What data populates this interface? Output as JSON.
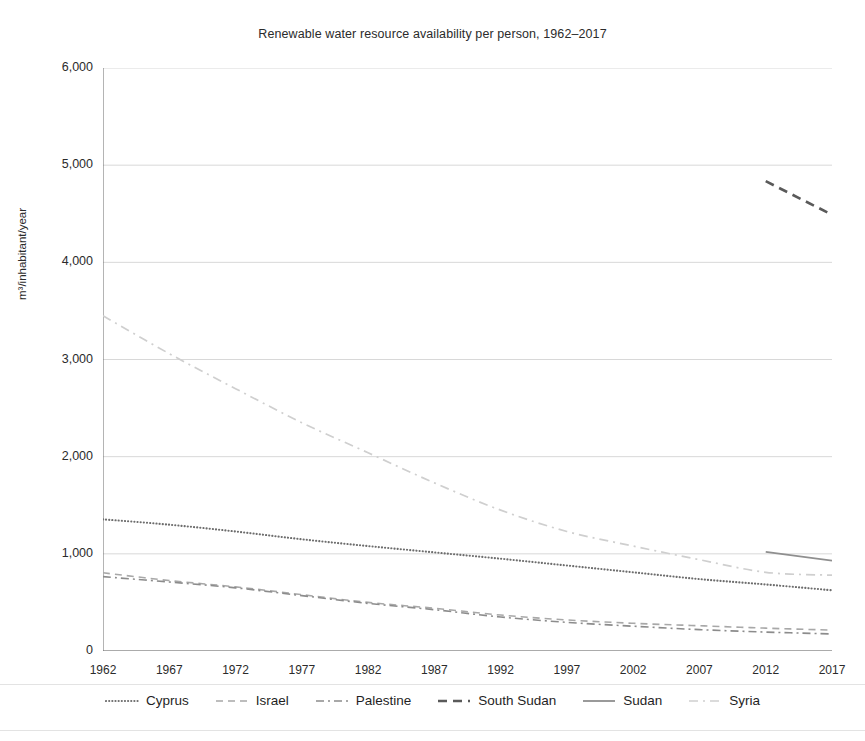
{
  "chart_data": {
    "type": "line",
    "title": "Renewable water resource availability per person, 1962–2017",
    "xlabel": "",
    "ylabel": "m³/inhabitant/year",
    "grid": true,
    "legend_position": "bottom",
    "xlim": [
      1962,
      2017
    ],
    "ylim": [
      0,
      6000
    ],
    "ytick_labels": [
      "6,000",
      "5,000",
      "4,000",
      "3,000",
      "2,000",
      "1,000",
      "0"
    ],
    "ytick_values": [
      6000,
      5000,
      4000,
      3000,
      2000,
      1000,
      0
    ],
    "xtick_labels": [
      "1962",
      "1967",
      "1972",
      "1977",
      "1982",
      "1987",
      "1992",
      "1997",
      "2002",
      "2007",
      "2012",
      "2017"
    ],
    "xtick_values": [
      1962,
      1967,
      1972,
      1977,
      1982,
      1987,
      1992,
      1997,
      2002,
      2007,
      2012,
      2017
    ],
    "series": [
      {
        "name": "Cyprus",
        "dash": "dotted",
        "color": "#6d6d6d",
        "width": 2.1,
        "x": [
          1962,
          1967,
          1972,
          1977,
          1982,
          1987,
          1992,
          1997,
          2002,
          2007,
          2012,
          2017
        ],
        "values": [
          1355,
          1300,
          1230,
          1150,
          1080,
          1015,
          950,
          880,
          810,
          740,
          685,
          625
        ]
      },
      {
        "name": "Israel",
        "dash": "dashed",
        "color": "#a8a8a8",
        "width": 1.6,
        "x": [
          1962,
          1967,
          1972,
          1977,
          1982,
          1987,
          1992,
          1997,
          2002,
          2007,
          2012,
          2017
        ],
        "values": [
          805,
          725,
          660,
          580,
          500,
          440,
          370,
          320,
          285,
          260,
          235,
          215
        ]
      },
      {
        "name": "Palestine",
        "dash": "dashdot",
        "color": "#8c8c8c",
        "width": 1.6,
        "x": [
          1962,
          1967,
          1972,
          1977,
          1982,
          1987,
          1992,
          1997,
          2002,
          2007,
          2012,
          2017
        ],
        "values": [
          765,
          710,
          650,
          570,
          490,
          425,
          350,
          295,
          255,
          220,
          195,
          175
        ]
      },
      {
        "name": "South Sudan",
        "dash": "dashed-thick",
        "color": "#5a5a5a",
        "width": 2.6,
        "x": [
          2012,
          2017
        ],
        "values": [
          4835,
          4490
        ]
      },
      {
        "name": "Sudan",
        "dash": "solid",
        "color": "#8f8f8f",
        "width": 1.8,
        "x": [
          2012,
          2017
        ],
        "values": [
          1020,
          930
        ]
      },
      {
        "name": "Syria",
        "dash": "dashdot-light",
        "color": "#cfcfcf",
        "width": 1.7,
        "x": [
          1962,
          1967,
          1972,
          1977,
          1982,
          1987,
          1992,
          1997,
          2002,
          2007,
          2012,
          2017
        ],
        "values": [
          3450,
          3060,
          2700,
          2350,
          2040,
          1730,
          1450,
          1230,
          1080,
          940,
          810,
          780
        ]
      }
    ]
  },
  "legend": {
    "items": [
      {
        "label": "Cyprus"
      },
      {
        "label": "Israel"
      },
      {
        "label": "Palestine"
      },
      {
        "label": "South Sudan"
      },
      {
        "label": "Sudan"
      },
      {
        "label": "Syria"
      }
    ]
  },
  "colors": {
    "grid": "#d8d8d8",
    "axis": "#6b6b6b",
    "text": "#2b2b2b",
    "background": "#ffffff"
  }
}
